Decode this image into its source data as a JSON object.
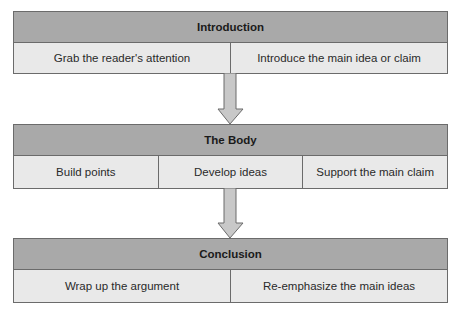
{
  "diagram": {
    "type": "flowchart",
    "colors": {
      "header_fill": "#a9a9a9",
      "cell_fill": "#e9e9e9",
      "border": "#6b6b6b",
      "arrow_fill": "#c8c8c8"
    },
    "stages": [
      {
        "title": "Introduction",
        "items": [
          "Grab the reader's attention",
          "Introduce the main idea or claim"
        ]
      },
      {
        "title": "The Body",
        "items": [
          "Build points",
          "Develop ideas",
          "Support the main claim"
        ]
      },
      {
        "title": "Conclusion",
        "items": [
          "Wrap up the argument",
          "Re-emphasize the main ideas"
        ]
      }
    ],
    "arrows": [
      {
        "from": "Introduction",
        "to": "The Body",
        "icon": "down-arrow-icon"
      },
      {
        "from": "The Body",
        "to": "Conclusion",
        "icon": "down-arrow-icon"
      }
    ]
  }
}
